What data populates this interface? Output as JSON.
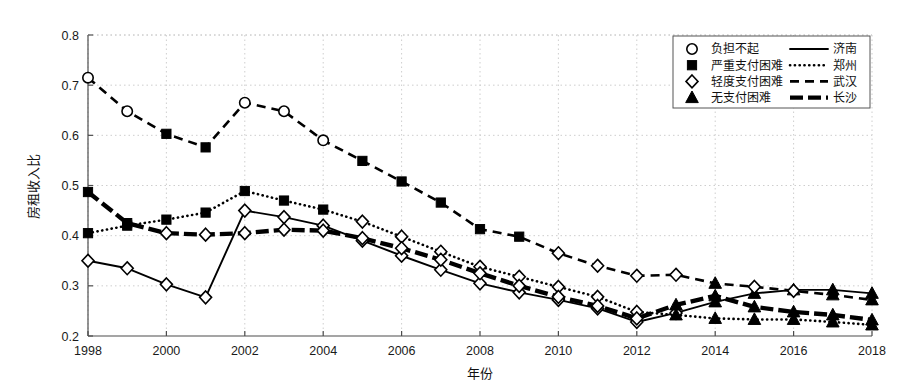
{
  "chart_data": {
    "type": "line",
    "title": "",
    "xlabel": "年份",
    "ylabel": "房租收入比",
    "xlim": [
      1998,
      2018
    ],
    "ylim": [
      0.2,
      0.8
    ],
    "xticks": [
      1998,
      2000,
      2002,
      2004,
      2006,
      2008,
      2010,
      2012,
      2014,
      2016,
      2018
    ],
    "yticks": [
      0.2,
      0.3,
      0.4,
      0.5,
      0.6,
      0.7,
      0.8
    ],
    "grid": true,
    "legend_position": "top-right",
    "x": [
      1998,
      1999,
      2000,
      2001,
      2002,
      2003,
      2004,
      2005,
      2006,
      2007,
      2008,
      2009,
      2010,
      2011,
      2012,
      2013,
      2014,
      2015,
      2016,
      2017,
      2018
    ],
    "series": [
      {
        "name": "济南",
        "style": "solid",
        "values": [
          0.35,
          0.335,
          0.303,
          0.277,
          0.45,
          0.437,
          0.42,
          0.39,
          0.36,
          0.332,
          0.305,
          0.287,
          0.272,
          0.255,
          0.228,
          0.246,
          0.268,
          0.285,
          0.292,
          0.292,
          0.285
        ],
        "markers": [
          "轻度支付困难",
          "轻度支付困难",
          "轻度支付困难",
          "轻度支付困难",
          "轻度支付困难",
          "轻度支付困难",
          "轻度支付困难",
          "轻度支付困难",
          "轻度支付困难",
          "轻度支付困难",
          "轻度支付困难",
          "轻度支付困难",
          "轻度支付困难",
          "轻度支付困难",
          "轻度支付困难",
          "轻度支付困难",
          "无支付困难",
          "无支付困难",
          "无支付困难",
          "无支付困难",
          "无支付困难"
        ]
      },
      {
        "name": "郑州",
        "style": "dotted",
        "values": [
          0.405,
          0.42,
          0.432,
          0.446,
          0.489,
          0.47,
          0.452,
          0.428,
          0.398,
          0.368,
          0.338,
          0.318,
          0.298,
          0.278,
          0.248,
          0.242,
          0.235,
          0.233,
          0.233,
          0.228,
          0.222
        ],
        "markers": [
          "严重支付困难",
          "严重支付困难",
          "严重支付困难",
          "严重支付困难",
          "严重支付困难",
          "严重支付困难",
          "严重支付困难",
          "轻度支付困难",
          "轻度支付困难",
          "轻度支付困难",
          "轻度支付困难",
          "轻度支付困难",
          "轻度支付困难",
          "轻度支付困难",
          "轻度支付困难",
          "无支付困难",
          "无支付困难",
          "无支付困难",
          "无支付困难",
          "无支付困难",
          "无支付困难"
        ]
      },
      {
        "name": "武汉",
        "style": "dashed",
        "values": [
          0.715,
          0.648,
          0.603,
          0.576,
          0.665,
          0.648,
          0.59,
          0.549,
          0.508,
          0.466,
          0.413,
          0.398,
          0.365,
          0.34,
          0.32,
          0.322,
          0.305,
          0.298,
          0.29,
          0.282,
          0.272
        ],
        "markers": [
          "负担不起",
          "负担不起",
          "严重支付困难",
          "严重支付困难",
          "负担不起",
          "负担不起",
          "负担不起",
          "严重支付困难",
          "严重支付困难",
          "严重支付困难",
          "严重支付困难",
          "严重支付困难",
          "轻度支付困难",
          "轻度支付困难",
          "轻度支付困难",
          "轻度支付困难",
          "无支付困难",
          "轻度支付困难",
          "轻度支付困难",
          "无支付困难",
          "无支付困难"
        ]
      },
      {
        "name": "长沙",
        "style": "thick-dash",
        "values": [
          0.487,
          0.425,
          0.405,
          0.402,
          0.405,
          0.412,
          0.41,
          0.395,
          0.375,
          0.352,
          0.325,
          0.3,
          0.278,
          0.26,
          0.235,
          0.262,
          0.28,
          0.258,
          0.248,
          0.242,
          0.232
        ],
        "markers": [
          "严重支付困难",
          "严重支付困难",
          "轻度支付困难",
          "轻度支付困难",
          "轻度支付困难",
          "轻度支付困难",
          "轻度支付困难",
          "轻度支付困难",
          "轻度支付困难",
          "轻度支付困难",
          "轻度支付困难",
          "轻度支付困难",
          "轻度支付困难",
          "轻度支付困难",
          "轻度支付困难",
          "无支付困难",
          "无支付困难",
          "无支付困难",
          "无支付困难",
          "无支付困难",
          "无支付困难"
        ]
      }
    ],
    "legend": {
      "markers": [
        {
          "symbol": "circle-open",
          "label": "负担不起"
        },
        {
          "symbol": "square-filled",
          "label": "严重支付困难"
        },
        {
          "symbol": "diamond-open",
          "label": "轻度支付困难"
        },
        {
          "symbol": "triangle-filled",
          "label": "无支付困难"
        }
      ],
      "lines": [
        {
          "style": "solid",
          "label": "济南"
        },
        {
          "style": "dotted",
          "label": "郑州"
        },
        {
          "style": "dashed",
          "label": "武汉"
        },
        {
          "style": "thick-dash",
          "label": "长沙"
        }
      ]
    },
    "colors": {
      "line": "#000000",
      "grid": "#c8c8c8",
      "axis": "#4d4d4d",
      "background": "#ffffff"
    }
  }
}
